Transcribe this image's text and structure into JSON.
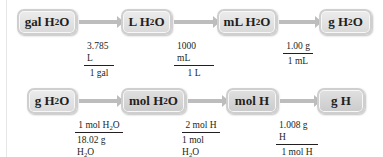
{
  "row1": {
    "boxes": [
      {
        "pre": "gal H",
        "sub": "2",
        "post": "O"
      },
      {
        "pre": "L H",
        "sub": "2",
        "post": "O"
      },
      {
        "pre": "mL H",
        "sub": "2",
        "post": "O"
      },
      {
        "pre": "g H",
        "sub": "2",
        "post": "O"
      }
    ],
    "factors": [
      {
        "num": "3.785 L",
        "den": "1 gal"
      },
      {
        "num": "1000 mL",
        "den": "1 L"
      },
      {
        "num": "1.00 g",
        "den": "1 mL"
      }
    ]
  },
  "row2": {
    "boxes": [
      {
        "pre": "g H",
        "sub": "2",
        "post": "O"
      },
      {
        "pre": "mol H",
        "sub": "2",
        "post": "O"
      },
      {
        "pre": "mol H",
        "sub": "",
        "post": ""
      },
      {
        "pre": "g H",
        "sub": "",
        "post": ""
      }
    ],
    "factors": [
      {
        "num_pre": "1 mol H",
        "num_sub": "2",
        "num_post": "O",
        "den_pre": "18.02 g H",
        "den_sub": "2",
        "den_post": "O"
      },
      {
        "num_pre": "2 mol H",
        "num_sub": "",
        "num_post": "",
        "den_pre": "1 mol H",
        "den_sub": "2",
        "den_post": "O"
      },
      {
        "num_pre": "1.008 g H",
        "num_sub": "",
        "num_post": "",
        "den_pre": "1 mol H",
        "den_sub": "",
        "den_post": ""
      }
    ]
  },
  "colors": {
    "box_fill": "#e3e3e3",
    "box_border": "#cfcfcf",
    "arrow": "#bdbdbd",
    "text": "#231f20"
  }
}
